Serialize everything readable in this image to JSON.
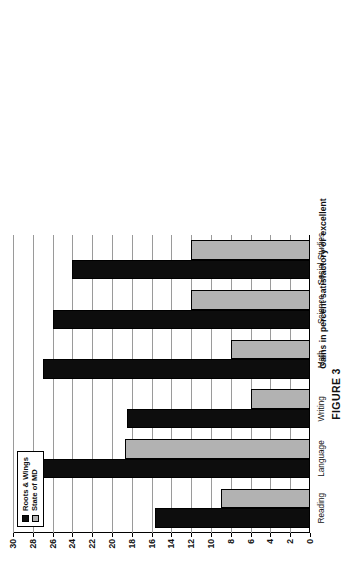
{
  "figure": {
    "caption": "FIGURE 3"
  },
  "chart_data": {
    "type": "bar",
    "orientation": "vertical-bars-rotated-page",
    "title": "",
    "xlabel": "",
    "ylabel": "Gains in percent satisfactory or excellent",
    "ylim": [
      0,
      30
    ],
    "ytick_step": 2,
    "yticks": [
      30,
      28,
      26,
      24,
      22,
      20,
      18,
      16,
      14,
      12,
      10,
      8,
      6,
      4,
      2,
      0
    ],
    "grid": true,
    "legend_position": "bottom-left",
    "categories": [
      "Reading",
      "Language",
      "Writing",
      "Math",
      "Science",
      "Social Studies"
    ],
    "series": [
      {
        "name": "Roots & Wings",
        "color": "#0d0d0d",
        "values": [
          15.7,
          27.8,
          18.5,
          27.0,
          26.0,
          24.0
        ]
      },
      {
        "name": "State of MD",
        "color": "#b2b2b2",
        "values": [
          9.0,
          18.7,
          6.0,
          8.0,
          12.0,
          12.0
        ]
      }
    ]
  }
}
